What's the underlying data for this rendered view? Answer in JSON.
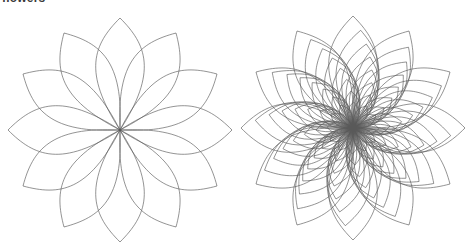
{
  "caption": {
    "text": "flowers",
    "clipped": true
  },
  "canvas": {
    "width": 476,
    "height": 252,
    "background": "#ffffff"
  },
  "style": {
    "stroke_color": "#5a5a5a",
    "stroke_width": 0.65,
    "fill": "none"
  },
  "figures": [
    {
      "name": "left-flower",
      "label": "simple 12-petal rosette",
      "center_x": 120,
      "center_y": 130,
      "petal_count": 12,
      "layers": 1,
      "layer_radii": [
        112
      ],
      "petal_half_angle_deg": 15,
      "bulge": 0.62,
      "rotation_deg": 0,
      "extent": {
        "left": 14,
        "top": 10,
        "right": 228,
        "bottom": 243
      }
    },
    {
      "name": "right-flower",
      "label": "nested multi-layer rosette",
      "center_x": 353,
      "center_y": 128,
      "petal_count": 12,
      "layers": 8,
      "layer_radii": [
        112,
        98,
        85,
        73,
        61,
        49,
        37,
        26
      ],
      "layer_rotation_step_deg": 4.5,
      "petal_half_angle_deg": 15,
      "bulge": 0.62,
      "rotation_deg": 0,
      "extent": {
        "left": 243,
        "top": 10,
        "right": 462,
        "bottom": 243
      }
    }
  ]
}
